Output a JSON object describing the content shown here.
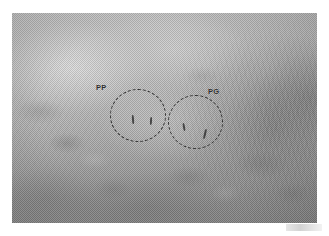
{
  "figure": {
    "name": "grayscale-micrograph",
    "modality": "grayscale photomicrograph",
    "background_color": "#ffffff",
    "photo": {
      "left": 12,
      "top": 13,
      "width": 305,
      "height": 210,
      "base_color": "#b0b0b0",
      "dark_color": "#8a8a8a",
      "light_color": "#c9c9c9"
    },
    "annotation_color": "#2e2e2e",
    "annotations": [
      {
        "label": "PP",
        "name": "region-pp",
        "circle": {
          "left": 98,
          "top": 76,
          "width": 56,
          "height": 53
        },
        "label_pos": {
          "left": 84,
          "top": 70
        },
        "ticks": [
          {
            "left": 22,
            "top": 26,
            "width": 2,
            "height": 9,
            "rotate": -4
          },
          {
            "left": 40,
            "top": 28,
            "width": 2,
            "height": 8,
            "rotate": 3
          }
        ]
      },
      {
        "label": "PG",
        "name": "region-pg",
        "circle": {
          "left": 156,
          "top": 82,
          "width": 55,
          "height": 54
        },
        "label_pos": {
          "left": 196,
          "top": 74
        },
        "ticks": [
          {
            "left": 15,
            "top": 28,
            "width": 2,
            "height": 8,
            "rotate": -10
          },
          {
            "left": 36,
            "top": 34,
            "width": 2,
            "height": 10,
            "rotate": 14
          }
        ]
      }
    ],
    "scan_smudge": {
      "present": true
    }
  }
}
